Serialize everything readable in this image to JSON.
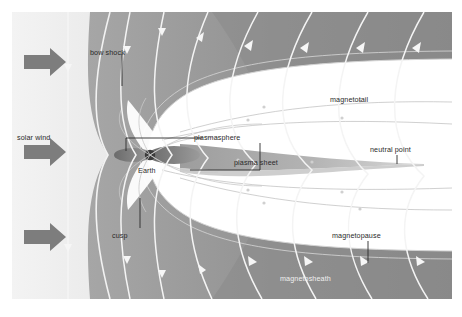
{
  "figure": {
    "background": "#ffffff",
    "frame": {
      "x": 12,
      "y": 12,
      "width": 440,
      "height": 287
    }
  },
  "colors": {
    "solar_wind_gradient_light": "#ececec",
    "solar_wind_gradient_dark": "#c9c9c9",
    "magnetosheath_gray": "#9a9a9a",
    "magnetotail_outer_dark": "#8a8a8a",
    "magnetosphere_interior": "#ffffff",
    "plasma_sheet": "#a8a8a8",
    "plasmasphere_lobe": "#6f6f6f",
    "earth": "#3a3a3a",
    "solar_wind_arrow": "#7d7d7d",
    "streamline_white": "#f4f4f4",
    "field_line_gray": "#c6c6c6",
    "label_text": "#2a2a2a",
    "leader_line": "#2a2a2a"
  },
  "labels": [
    {
      "id": "bow-shock",
      "text": "bow shock",
      "x": 78,
      "y": 42,
      "leader": true
    },
    {
      "id": "solar-wind",
      "text": "solar wind",
      "x": 17,
      "y": 140,
      "leader": false
    },
    {
      "id": "cusp",
      "text": "cusp",
      "x": 112,
      "y": 229,
      "leader": true
    },
    {
      "id": "earth",
      "text": "Earth",
      "x": 138,
      "y": 175,
      "leader": false
    },
    {
      "id": "plasmasphere",
      "text": "plasmasphere",
      "x": 194,
      "y": 137,
      "leader": true
    },
    {
      "id": "plasma-sheet",
      "text": "plasma sheet",
      "x": 234,
      "y": 161,
      "leader": false
    },
    {
      "id": "magnetotail",
      "text": "magnetotail",
      "x": 330,
      "y": 99,
      "leader": false
    },
    {
      "id": "neutral-point",
      "text": "neutral point",
      "x": 355,
      "y": 147,
      "leader": true
    },
    {
      "id": "magnetopause",
      "text": "magnetopause",
      "x": 330,
      "y": 229,
      "leader": true
    },
    {
      "id": "magnetosheath",
      "text": "magnetosheath",
      "x": 280,
      "y": 281,
      "leader": false
    }
  ],
  "regions": [
    {
      "name": "solar-wind-region",
      "description": "upstream flow, light gradient at far left"
    },
    {
      "name": "bow-shock-surface",
      "description": "parabolic shock front ahead of magnetosphere"
    },
    {
      "name": "magnetosheath-region",
      "description": "shocked plasma between bow shock and magnetopause"
    },
    {
      "name": "magnetopause-boundary",
      "description": "outer boundary of magnetosphere"
    },
    {
      "name": "magnetotail-region",
      "description": "elongated tail downstream of Earth"
    },
    {
      "name": "plasma-sheet-region",
      "description": "tapering sheet along tail midplane"
    },
    {
      "name": "plasmasphere-region",
      "description": "dark lobes hugging Earth"
    },
    {
      "name": "cusp-region",
      "description": "polar funnels above and below Earth"
    },
    {
      "name": "earth-body",
      "description": "planet at center"
    }
  ],
  "solar_wind_arrows": [
    {
      "id": "arrow-1",
      "y": 62
    },
    {
      "id": "arrow-2",
      "y": 152
    },
    {
      "id": "arrow-3",
      "y": 237
    }
  ],
  "streamline_count": 11,
  "field_line_count": 9
}
